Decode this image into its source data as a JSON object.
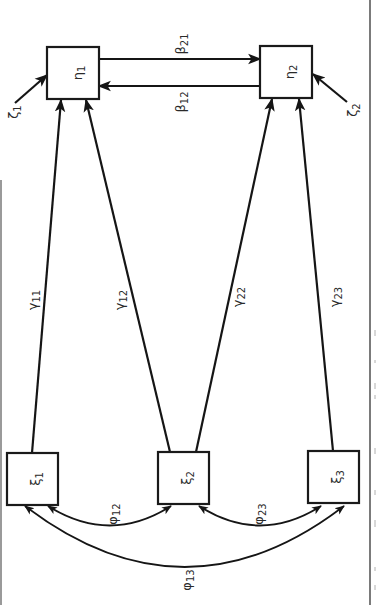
{
  "diagram": {
    "type": "structural-equation-path-diagram",
    "orientation": "rotated-90-clockwise",
    "colors": {
      "stroke": "#151515",
      "background": "#ffffff",
      "text": "#2a2a2a"
    },
    "endogenous": [
      {
        "id": "eta1",
        "symbol": "η",
        "sub": "1"
      },
      {
        "id": "eta2",
        "symbol": "η",
        "sub": "2"
      }
    ],
    "exogenous": [
      {
        "id": "xi1",
        "symbol": "ξ",
        "sub": "1"
      },
      {
        "id": "xi2",
        "symbol": "ξ",
        "sub": "2"
      },
      {
        "id": "xi3",
        "symbol": "ξ",
        "sub": "3"
      }
    ],
    "disturbances": [
      {
        "id": "zeta1",
        "symbol": "ζ",
        "sub": "1",
        "target": "eta1"
      },
      {
        "id": "zeta2",
        "symbol": "ζ",
        "sub": "2",
        "target": "eta2"
      }
    ],
    "betas": [
      {
        "id": "beta21",
        "symbol": "β",
        "sub": "21",
        "from": "eta1",
        "to": "eta2"
      },
      {
        "id": "beta12",
        "symbol": "β",
        "sub": "12",
        "from": "eta2",
        "to": "eta1"
      }
    ],
    "gammas": [
      {
        "id": "gamma11",
        "symbol": "γ",
        "sub": "11",
        "from": "xi1",
        "to": "eta1"
      },
      {
        "id": "gamma12",
        "symbol": "γ",
        "sub": "12",
        "from": "xi2",
        "to": "eta1"
      },
      {
        "id": "gamma22",
        "symbol": "γ",
        "sub": "22",
        "from": "xi2",
        "to": "eta2"
      },
      {
        "id": "gamma23",
        "symbol": "γ",
        "sub": "23",
        "from": "xi3",
        "to": "eta2"
      }
    ],
    "phis": [
      {
        "id": "phi12",
        "symbol": "φ",
        "sub": "12",
        "between": [
          "xi1",
          "xi2"
        ]
      },
      {
        "id": "phi23",
        "symbol": "φ",
        "sub": "23",
        "between": [
          "xi2",
          "xi3"
        ]
      },
      {
        "id": "phi13",
        "symbol": "φ",
        "sub": "13",
        "between": [
          "xi1",
          "xi3"
        ]
      }
    ]
  }
}
